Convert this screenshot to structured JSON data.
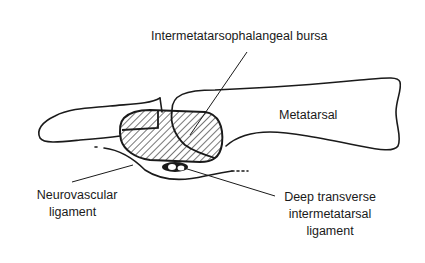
{
  "diagram": {
    "type": "anatomical line drawing",
    "labels": {
      "bursa": "Intermetatarsophalangeal bursa",
      "metatarsal": "Metatarsal",
      "neurovascular": [
        "Neurovascular",
        "ligament"
      ],
      "deep_transverse": [
        "Deep transverse",
        "intermetatarsal",
        "ligament"
      ]
    },
    "colors": {
      "ink": "#1a1a1a",
      "background": "#ffffff"
    }
  }
}
